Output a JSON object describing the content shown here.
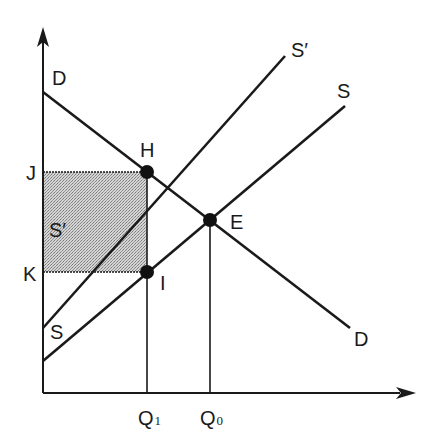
{
  "diagram": {
    "type": "supply-demand-tax",
    "axes": {
      "y_axis": {
        "label": ""
      },
      "x_axis": {
        "label": ""
      }
    },
    "curves": {
      "demand": {
        "label_top": "D",
        "label_bottom": "D"
      },
      "supply": {
        "label_top": "S",
        "label_bottom": "S"
      },
      "supply_shifted": {
        "label_top": "S′",
        "label_inside": "S′"
      }
    },
    "points": {
      "H": "H",
      "I": "I",
      "E": "E"
    },
    "price_labels": {
      "J": "J",
      "K": "K"
    },
    "quantity_labels": {
      "Q1": {
        "main": "Q",
        "sub": "1"
      },
      "Q0": {
        "main": "Q",
        "sub": "0"
      }
    },
    "shaded_region": {
      "corners": [
        "J",
        "H",
        "I",
        "K"
      ],
      "fill": "#b8b8b8"
    },
    "colors": {
      "ink": "#1a1a1a",
      "shade": "#b8b8b8",
      "background": "#ffffff"
    }
  }
}
